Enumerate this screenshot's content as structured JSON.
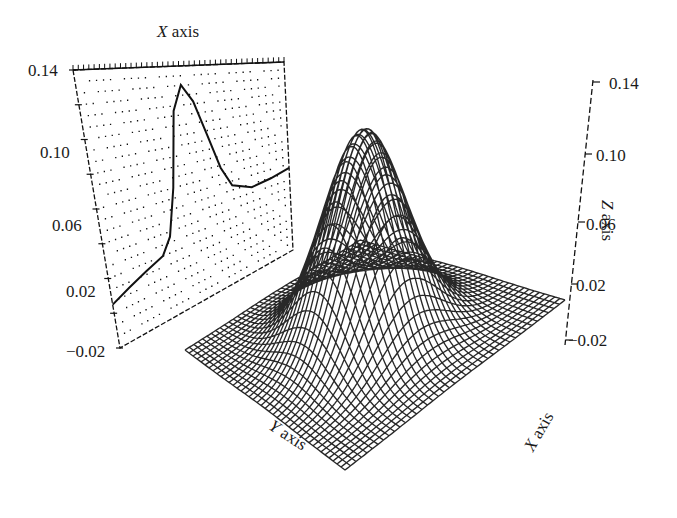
{
  "chart_data": {
    "type": "surface3d",
    "title": "",
    "surface": {
      "function": "z = A * exp(-(x^2 + y^2) / (2*sigma^2)) + offset",
      "peak_z": 0.14,
      "baseline_z": 0.0,
      "grid_lines": 40,
      "x_range": [
        -1,
        1
      ],
      "y_range": [
        -1,
        1
      ]
    },
    "projection_panel": {
      "axis_title": "X axis",
      "z_ticks": [
        "0.14",
        "0.10",
        "0.06",
        "0.02",
        "-0.02"
      ],
      "z_range": [
        -0.02,
        0.14
      ],
      "profile": {
        "x": [
          0.0,
          0.1,
          0.2,
          0.3,
          0.35,
          0.4,
          0.45,
          0.5,
          0.55,
          0.6,
          0.65,
          0.7,
          0.8,
          0.9,
          1.0
        ],
        "z": [
          0.005,
          0.01,
          0.015,
          0.02,
          0.03,
          0.06,
          0.11,
          0.127,
          0.115,
          0.09,
          0.065,
          0.05,
          0.044,
          0.046,
          0.05
        ]
      }
    },
    "z_axis": {
      "label": "Z axis",
      "ticks": [
        "0.14",
        "0.10",
        "0.06",
        "0.02",
        "-0.02"
      ],
      "range": [
        -0.02,
        0.14
      ]
    },
    "y_axis": {
      "label": "Y axis"
    },
    "x_axis": {
      "label": "X axis"
    },
    "grid": true,
    "legend": null
  },
  "labels": {
    "panel_title_var": "X",
    "panel_title_rest": " axis",
    "z_axis_var": "Z",
    "z_axis_rest": " axis",
    "y_axis_var": "Y",
    "y_axis_rest": " axis",
    "x_axis_var": "X",
    "x_axis_rest": " axis",
    "left_ticks": [
      "0.14",
      "0.10",
      "0.06",
      "0.02",
      "−0.02"
    ],
    "right_ticks": [
      "0.14",
      "0.10",
      "0.06",
      "0.02",
      "−0.02"
    ]
  },
  "colors": {
    "ink": "#111111",
    "background": "#ffffff"
  }
}
